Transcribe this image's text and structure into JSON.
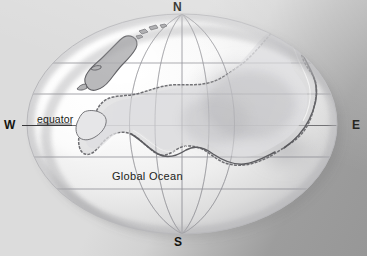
{
  "figure": {
    "type": "globe-map-illustration",
    "background_color": "#d7d7d7",
    "background_shadow_color": "#979797"
  },
  "labels": {
    "north": "N",
    "south": "S",
    "west": "W",
    "east": "E",
    "equator": "equator",
    "ocean": "Global Ocean"
  },
  "colors": {
    "globe_light": "#ffffff",
    "globe_mid": "#e3e3e3",
    "globe_shade": "#b9b9b9",
    "graticule": "#8d8d93",
    "equator_line": "#5a5a5e",
    "coast_line": "#6e6e72",
    "land_fill": "#c9c9cb",
    "label_text": "#14140f"
  },
  "graticule": {
    "latitude_count": 5,
    "meridian_count": 5,
    "equator_visible": true,
    "grid": "on"
  },
  "geometry": {
    "ellipse_center_x": 182,
    "ellipse_center_y": 124,
    "ellipse_radius_x": 155,
    "ellipse_radius_y": 110
  }
}
